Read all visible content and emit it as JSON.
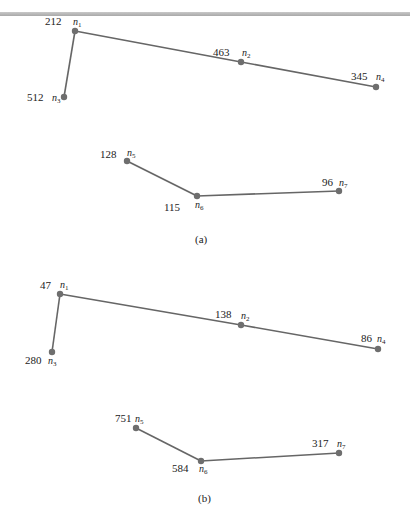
{
  "figure": {
    "edge_color": "#666666",
    "node_color": "#6e6e6e",
    "panels": [
      {
        "caption": "(a)",
        "nodes": [
          {
            "id": "n1",
            "base": "n",
            "sub": "1",
            "value": "212"
          },
          {
            "id": "n2",
            "base": "n",
            "sub": "2",
            "value": "463"
          },
          {
            "id": "n3",
            "base": "n",
            "sub": "3",
            "value": "512"
          },
          {
            "id": "n4",
            "base": "n",
            "sub": "4",
            "value": "345"
          },
          {
            "id": "n5",
            "base": "n",
            "sub": "5",
            "value": "128"
          },
          {
            "id": "n6",
            "base": "n",
            "sub": "6",
            "value": "115"
          },
          {
            "id": "n7",
            "base": "n",
            "sub": "7",
            "value": "96"
          }
        ],
        "edges": [
          [
            "n3",
            "n1"
          ],
          [
            "n1",
            "n2"
          ],
          [
            "n2",
            "n4"
          ],
          [
            "n5",
            "n6"
          ],
          [
            "n6",
            "n7"
          ]
        ]
      },
      {
        "caption": "(b)",
        "nodes": [
          {
            "id": "n1",
            "base": "n",
            "sub": "1",
            "value": "47"
          },
          {
            "id": "n2",
            "base": "n",
            "sub": "2",
            "value": "138"
          },
          {
            "id": "n3",
            "base": "n",
            "sub": "3",
            "value": "280"
          },
          {
            "id": "n4",
            "base": "n",
            "sub": "4",
            "value": "86"
          },
          {
            "id": "n5",
            "base": "n",
            "sub": "5",
            "value": "751"
          },
          {
            "id": "n6",
            "base": "n",
            "sub": "6",
            "value": "584"
          },
          {
            "id": "n7",
            "base": "n",
            "sub": "7",
            "value": "317"
          }
        ],
        "edges": [
          [
            "n3",
            "n1"
          ],
          [
            "n1",
            "n2"
          ],
          [
            "n2",
            "n4"
          ],
          [
            "n5",
            "n6"
          ],
          [
            "n6",
            "n7"
          ]
        ]
      }
    ]
  }
}
